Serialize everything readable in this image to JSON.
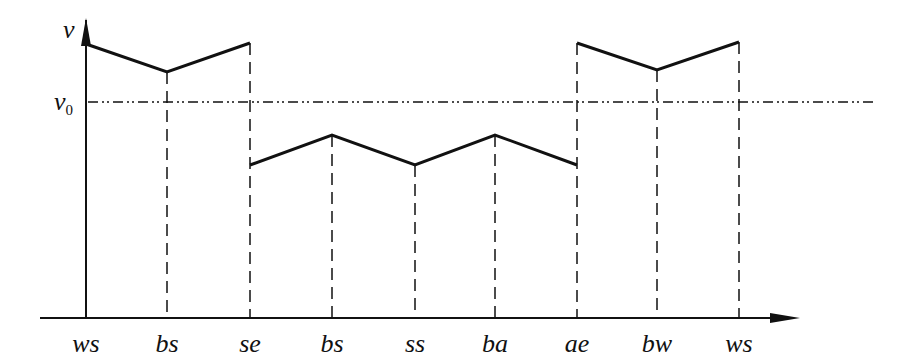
{
  "diagram": {
    "y_axis_label": "v",
    "ref_label": "v",
    "ref_subscript": "0",
    "x_labels": [
      "ws",
      "bs",
      "se",
      "bs",
      "ss",
      "ba",
      "ae",
      "bw",
      "ws"
    ],
    "x_positions": [
      86,
      167,
      250,
      332,
      415,
      495,
      577,
      657,
      739
    ],
    "segments": [
      {
        "points": [
          [
            86,
            44
          ],
          [
            167,
            72
          ],
          [
            250,
            43
          ]
        ]
      },
      {
        "points": [
          [
            250,
            165
          ],
          [
            332,
            135
          ],
          [
            415,
            165
          ],
          [
            495,
            135
          ],
          [
            577,
            165
          ]
        ]
      },
      {
        "points": [
          [
            577,
            43
          ],
          [
            657,
            70
          ],
          [
            739,
            42
          ]
        ]
      }
    ],
    "line_color": "#111111"
  }
}
